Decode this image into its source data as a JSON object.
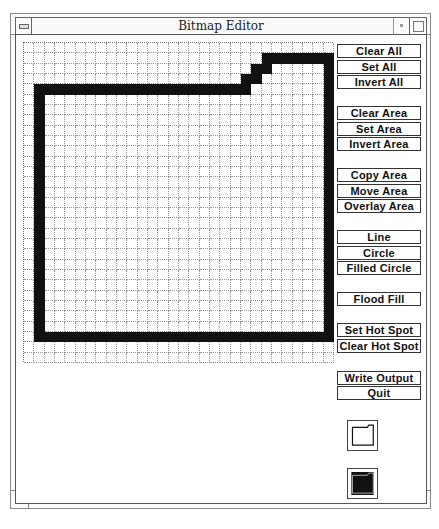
{
  "window": {
    "title": "Bitmap Editor",
    "controls": [
      "menu-icon",
      "iconify-icon",
      "maximize-icon"
    ]
  },
  "bitmap": {
    "columns": 30,
    "rows": 31,
    "set_pixels": {
      "1": [
        [
          23,
          29
        ]
      ],
      "2": [
        [
          22,
          23
        ],
        [
          29,
          29
        ]
      ],
      "3": [
        [
          21,
          22
        ],
        [
          29,
          29
        ]
      ],
      "4": [
        [
          1,
          21
        ],
        [
          29,
          29
        ]
      ],
      "5-27": [
        [
          1,
          1
        ],
        [
          29,
          29
        ]
      ],
      "28": [
        [
          1,
          29
        ]
      ]
    },
    "on_color": "#111111",
    "off_color": "#ffffff"
  },
  "buttons": [
    {
      "id": "clear-all",
      "label": "Clear All",
      "top": 44
    },
    {
      "id": "set-all",
      "label": "Set All",
      "top": 60
    },
    {
      "id": "invert-all",
      "label": "Invert All",
      "top": 75
    },
    {
      "id": "clear-area",
      "label": "Clear Area",
      "top": 106
    },
    {
      "id": "set-area",
      "label": "Set Area",
      "top": 122
    },
    {
      "id": "invert-area",
      "label": "Invert Area",
      "top": 137
    },
    {
      "id": "copy-area",
      "label": "Copy Area",
      "top": 168
    },
    {
      "id": "move-area",
      "label": "Move Area",
      "top": 184
    },
    {
      "id": "overlay-area",
      "label": "Overlay Area",
      "top": 199
    },
    {
      "id": "line",
      "label": "Line",
      "top": 230
    },
    {
      "id": "circle",
      "label": "Circle",
      "top": 246
    },
    {
      "id": "filled-circle",
      "label": "Filled Circle",
      "top": 261
    },
    {
      "id": "flood-fill",
      "label": "Flood Fill",
      "top": 292
    },
    {
      "id": "set-hot-spot",
      "label": "Set Hot Spot",
      "top": 323
    },
    {
      "id": "clear-hot-spot",
      "label": "Clear Hot Spot",
      "top": 339
    },
    {
      "id": "write-output",
      "label": "Write Output",
      "top": 371
    },
    {
      "id": "quit",
      "label": "Quit",
      "top": 386
    }
  ],
  "previews": [
    {
      "id": "normal-preview",
      "mode": "normal",
      "top": 420
    },
    {
      "id": "inverted-preview",
      "mode": "inverted",
      "top": 468
    }
  ]
}
